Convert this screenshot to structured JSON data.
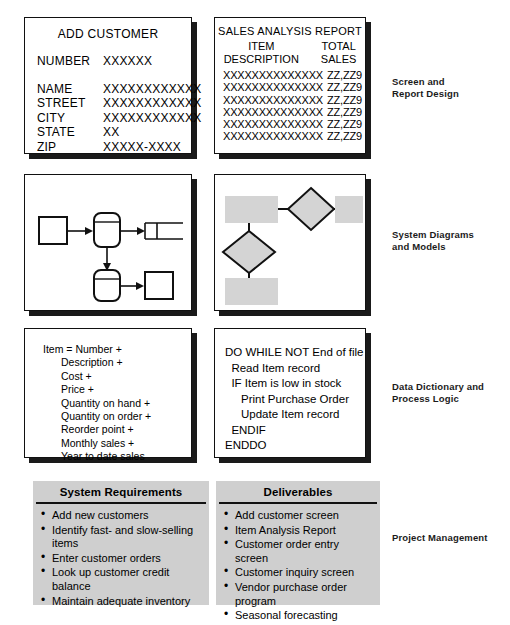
{
  "figure": {
    "rows": [
      {
        "stage_label": "Screen and\nReport Design",
        "stage_label_line1": "Screen and",
        "stage_label_line2": "Report Design"
      },
      {
        "stage_label_line1": "System Diagrams",
        "stage_label_line2": "and Models"
      },
      {
        "stage_label_line1": "Data Dictionary and",
        "stage_label_line2": "Process Logic"
      },
      {
        "stage_label_line1": "Project Management",
        "stage_label_line2": ""
      }
    ]
  },
  "screen_design": {
    "title": "ADD CUSTOMER",
    "number_label": "NUMBER",
    "number_value": "XXXXXX",
    "fields": [
      {
        "label": "NAME",
        "value": "XXXXXXXXXXXX"
      },
      {
        "label": "STREET",
        "value": "XXXXXXXXXXXX"
      },
      {
        "label": "CITY",
        "value": "XXXXXXXXXXXX"
      },
      {
        "label": "STATE",
        "value": "XX"
      },
      {
        "label": "ZIP",
        "value": "XXXXX-XXXX"
      }
    ]
  },
  "report_design": {
    "title": "SALES ANALYSIS REPORT",
    "columns": [
      {
        "line1": "ITEM",
        "line2": "DESCRIPTION"
      },
      {
        "line1": "TOTAL",
        "line2": "SALES"
      }
    ],
    "rows": [
      {
        "description": "XXXXXXXXXXXXXX",
        "total_sales": "ZZ,ZZ9"
      },
      {
        "description": "XXXXXXXXXXXXXX",
        "total_sales": "ZZ,ZZ9"
      },
      {
        "description": "XXXXXXXXXXXXXX",
        "total_sales": "ZZ,ZZ9"
      },
      {
        "description": "XXXXXXXXXXXXXX",
        "total_sales": "ZZ,ZZ9"
      },
      {
        "description": "XXXXXXXXXXXXXX",
        "total_sales": "ZZ,ZZ9"
      },
      {
        "description": "XXXXXXXXXXXXXX",
        "total_sales": "ZZ,ZZ9"
      }
    ]
  },
  "data_flow_diagram": {
    "caption": "",
    "shapes": [
      {
        "name": "external-entity-square",
        "type": "square"
      },
      {
        "name": "process-rounded-top",
        "type": "rounded-rect-divided"
      },
      {
        "name": "data-store-open-rect",
        "type": "open-rect"
      },
      {
        "name": "process-rounded-bottom",
        "type": "rounded-rect-divided"
      },
      {
        "name": "external-entity-square-2",
        "type": "square"
      }
    ]
  },
  "model_diagram": {
    "caption": "",
    "shapes": [
      {
        "name": "entity-box-top-left",
        "type": "rect",
        "fill": "#d4d4d4"
      },
      {
        "name": "relationship-diamond-top",
        "type": "diamond",
        "fill": "#d4d4d4"
      },
      {
        "name": "entity-box-top-right",
        "type": "rect",
        "fill": "#d4d4d4"
      },
      {
        "name": "relationship-diamond-left",
        "type": "diamond",
        "fill": "#d4d4d4"
      },
      {
        "name": "entity-box-bottom-left",
        "type": "rect",
        "fill": "#d4d4d4"
      }
    ]
  },
  "data_dictionary": {
    "lines": [
      "Item = Number +",
      "Description +",
      "Cost +",
      "Price +",
      "Quantity on hand +",
      "Quantity on order +",
      "Reorder point +",
      "Monthly sales +",
      "Year to date sales"
    ]
  },
  "process_logic": {
    "lines": [
      "DO WHILE NOT End of file",
      "  Read Item record",
      "  IF Item is low in stock",
      "     Print Purchase Order",
      "     Update Item record",
      "  ENDIF",
      "ENDDO"
    ]
  },
  "system_requirements": {
    "title": "System Requirements",
    "items": [
      "Add new customers",
      "Identify fast- and slow-selling items",
      "Enter customer orders",
      "Look up customer credit balance",
      "Maintain adequate inventory"
    ]
  },
  "deliverables": {
    "title": "Deliverables",
    "items": [
      "Add customer screen",
      "Item Analysis Report",
      "Customer order entry screen",
      "Customer inquiry screen",
      "Vendor purchase order program",
      "Seasonal forecasting"
    ]
  },
  "colors": {
    "panel_border": "#111111",
    "panel_shadow": "#1a1a1a",
    "gray_panel": "#cfcfcf",
    "diagram_fill": "#d4d4d4",
    "text": "#000000"
  }
}
